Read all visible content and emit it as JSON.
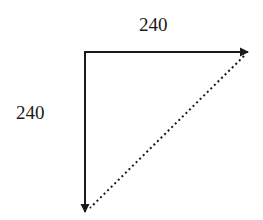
{
  "diagram": {
    "type": "vector-triangle",
    "labels": {
      "horizontal": "240",
      "vertical": "240"
    },
    "colors": {
      "stroke": "#1a1a1a",
      "background": "#ffffff"
    },
    "vectors": [
      {
        "name": "horizontal-vector",
        "from": [
          85,
          52
        ],
        "to": [
          248,
          52
        ],
        "style": "solid",
        "label": "240"
      },
      {
        "name": "vertical-vector",
        "from": [
          85,
          52
        ],
        "to": [
          85,
          212
        ],
        "style": "solid",
        "label": "240"
      },
      {
        "name": "resultant-diagonal",
        "from": [
          244,
          56
        ],
        "to": [
          89,
          209
        ],
        "style": "dotted"
      }
    ]
  }
}
